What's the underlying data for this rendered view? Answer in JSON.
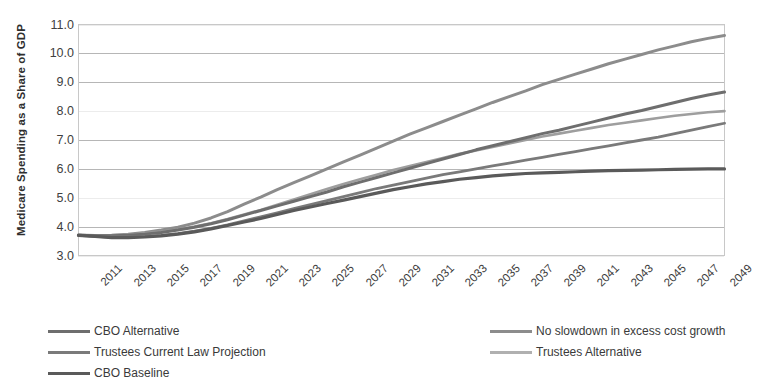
{
  "chart_data": {
    "type": "line",
    "title": "",
    "xlabel": "",
    "ylabel": "Medicare Spending as a Share of GDP",
    "ylim": [
      3.0,
      11.0
    ],
    "xlim": [
      2011,
      2050
    ],
    "grid": true,
    "legend_position": "bottom",
    "yticks": [
      "11.0",
      "10.0",
      "9.0",
      "8.0",
      "7.0",
      "6.0",
      "5.0",
      "4.0",
      "3.0"
    ],
    "ytick_values": [
      11.0,
      10.0,
      9.0,
      8.0,
      7.0,
      6.0,
      5.0,
      4.0,
      3.0
    ],
    "xticks": [
      "2011",
      "2013",
      "2015",
      "2017",
      "2019",
      "2021",
      "2023",
      "2025",
      "2027",
      "2029",
      "2031",
      "2033",
      "2035",
      "2037",
      "2039",
      "2041",
      "2043",
      "2045",
      "2047",
      "2049"
    ],
    "xtick_values": [
      2011,
      2013,
      2015,
      2017,
      2019,
      2021,
      2023,
      2025,
      2027,
      2029,
      2031,
      2033,
      2035,
      2037,
      2039,
      2041,
      2043,
      2045,
      2047,
      2049
    ],
    "x": [
      2011,
      2012,
      2013,
      2014,
      2015,
      2016,
      2017,
      2018,
      2019,
      2020,
      2021,
      2022,
      2023,
      2024,
      2025,
      2026,
      2027,
      2028,
      2029,
      2030,
      2031,
      2032,
      2033,
      2034,
      2035,
      2036,
      2037,
      2038,
      2039,
      2040,
      2041,
      2042,
      2043,
      2044,
      2045,
      2046,
      2047,
      2048,
      2049,
      2050
    ],
    "series": [
      {
        "name": "No slowdown in excess cost growth",
        "color": "#8c8c8c",
        "width": 3.0,
        "values": [
          3.7,
          3.68,
          3.7,
          3.74,
          3.8,
          3.88,
          3.98,
          4.12,
          4.3,
          4.52,
          4.78,
          5.02,
          5.28,
          5.52,
          5.76,
          6.0,
          6.24,
          6.48,
          6.72,
          6.96,
          7.2,
          7.42,
          7.64,
          7.86,
          8.08,
          8.3,
          8.5,
          8.7,
          8.92,
          9.1,
          9.28,
          9.46,
          9.64,
          9.8,
          9.96,
          10.12,
          10.26,
          10.4,
          10.52,
          10.62
        ]
      },
      {
        "name": "Trustees Alternative",
        "color": "#9e9e9e",
        "width": 2.6,
        "values": [
          3.72,
          3.7,
          3.7,
          3.72,
          3.76,
          3.82,
          3.9,
          4.0,
          4.12,
          4.26,
          4.42,
          4.58,
          4.76,
          4.94,
          5.12,
          5.3,
          5.48,
          5.64,
          5.8,
          5.96,
          6.1,
          6.24,
          6.38,
          6.52,
          6.64,
          6.76,
          6.88,
          7.0,
          7.12,
          7.22,
          7.32,
          7.42,
          7.52,
          7.6,
          7.68,
          7.76,
          7.84,
          7.9,
          7.96,
          8.0
        ]
      },
      {
        "name": "CBO Alternative",
        "color": "#6e6e6e",
        "width": 3.0,
        "values": [
          3.7,
          3.68,
          3.68,
          3.7,
          3.74,
          3.8,
          3.88,
          3.98,
          4.1,
          4.24,
          4.4,
          4.56,
          4.72,
          4.88,
          5.04,
          5.2,
          5.38,
          5.54,
          5.7,
          5.86,
          6.02,
          6.18,
          6.34,
          6.5,
          6.66,
          6.8,
          6.94,
          7.08,
          7.22,
          7.34,
          7.48,
          7.62,
          7.76,
          7.9,
          8.02,
          8.16,
          8.3,
          8.44,
          8.56,
          8.66
        ]
      },
      {
        "name": "Trustees Current Law Projection",
        "color": "#7a7a7a",
        "width": 2.8,
        "values": [
          3.7,
          3.66,
          3.64,
          3.64,
          3.66,
          3.7,
          3.76,
          3.84,
          3.94,
          4.06,
          4.2,
          4.34,
          4.48,
          4.62,
          4.76,
          4.9,
          5.04,
          5.18,
          5.32,
          5.44,
          5.56,
          5.68,
          5.8,
          5.9,
          6.0,
          6.1,
          6.2,
          6.3,
          6.4,
          6.5,
          6.6,
          6.7,
          6.8,
          6.9,
          7.0,
          7.1,
          7.22,
          7.34,
          7.46,
          7.58
        ]
      },
      {
        "name": "CBO Baseline",
        "color": "#5a5a5a",
        "width": 3.2,
        "values": [
          3.7,
          3.66,
          3.62,
          3.62,
          3.64,
          3.68,
          3.74,
          3.82,
          3.92,
          4.04,
          4.16,
          4.28,
          4.42,
          4.56,
          4.68,
          4.8,
          4.92,
          5.04,
          5.16,
          5.28,
          5.38,
          5.48,
          5.56,
          5.64,
          5.7,
          5.76,
          5.8,
          5.84,
          5.86,
          5.88,
          5.9,
          5.92,
          5.94,
          5.95,
          5.96,
          5.97,
          5.98,
          5.99,
          6.0,
          6.0
        ]
      }
    ],
    "legend": [
      {
        "label": "CBO Alternative",
        "color": "#6e6e6e",
        "column": 0,
        "row": 0
      },
      {
        "label": "Trustees Current Law Projection",
        "color": "#7a7a7a",
        "column": 0,
        "row": 1
      },
      {
        "label": "CBO Baseline",
        "color": "#5a5a5a",
        "column": 0,
        "row": 2
      },
      {
        "label": "No slowdown in excess cost growth",
        "color": "#8c8c8c",
        "column": 1,
        "row": 0
      },
      {
        "label": "Trustees Alternative",
        "color": "#b0b0b0",
        "column": 1,
        "row": 1
      }
    ]
  }
}
